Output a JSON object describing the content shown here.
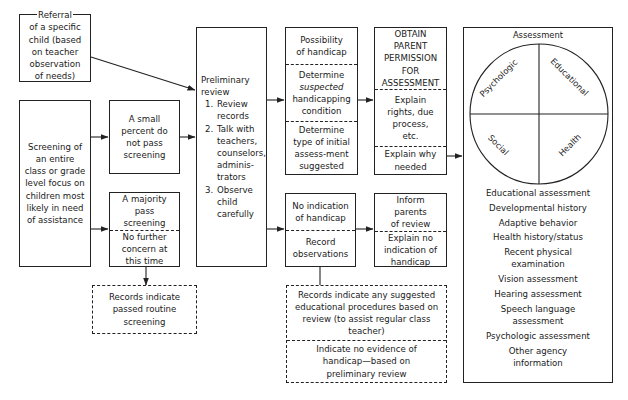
{
  "diagram": {
    "type": "flowchart"
  },
  "referral": {
    "lines": [
      "Referral",
      "of a specific",
      "child (based",
      "on teacher",
      "observation",
      "of needs)"
    ]
  },
  "screening": {
    "text": "Screening of an entire class or grade level focus on children most likely in need of assistance"
  },
  "small_percent": {
    "text": "A small percent do not pass screening"
  },
  "majority": {
    "top": "A majority pass screening",
    "bottom": "No further concern at this time"
  },
  "records_routine": {
    "text": "Records indicate passed routine screening"
  },
  "preliminary_review": {
    "title": "Preliminary review",
    "steps": [
      "Review records",
      "Talk with teachers, counselors, adminis-trators",
      "Observe child carefully"
    ]
  },
  "possibility": {
    "sections": [
      {
        "text": "Possibility of handicap"
      },
      {
        "pre": "Determine ",
        "em": "suspected",
        "post": " handicapping condition"
      },
      {
        "text": "Determine type of initial assess-ment suggested"
      }
    ]
  },
  "obtain_permission": {
    "sections": [
      "OBTAIN PARENT PERMISSION FOR ASSESSMENT",
      "Explain rights, due process, etc.",
      "Explain why needed"
    ]
  },
  "no_indication": {
    "sections": [
      "No indication of handicap",
      "Record observations"
    ]
  },
  "inform_parents": {
    "sections": [
      "Inform parents of review",
      "Explain no indication of handicap"
    ]
  },
  "records_suggested": {
    "sections": [
      "Records indicate any suggested educational procedures based on review (to assist regular class teacher)",
      "Indicate no evidence of handicap—based on preliminary review"
    ]
  },
  "assessment": {
    "title": "Assessment",
    "quadrants": {
      "top_left": "Psychologic",
      "top_right": "Educational",
      "bottom_left": "Social",
      "bottom_right": "Health"
    },
    "items": [
      "Educational assessment",
      "Developmental history",
      "Adaptive behavior",
      "Health history/status",
      "Recent physical examination",
      "Vision assessment",
      "Hearing assessment",
      "Speech language assessment",
      "Psychologic assessment",
      "Other agency information"
    ]
  },
  "colors": {
    "line": "#222222",
    "background": "#ffffff",
    "text": "#1a1a1a"
  }
}
